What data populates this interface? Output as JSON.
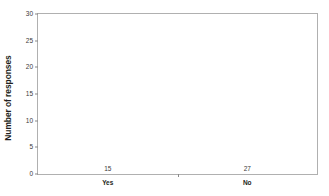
{
  "chart_data": {
    "type": "bar",
    "title": "",
    "xlabel": "",
    "ylabel": "Number of responses",
    "categories": [
      "Yes",
      "No"
    ],
    "values": [
      15,
      27
    ],
    "data_labels": [
      "15",
      "27"
    ],
    "bar_colors": [
      "#7f99cf",
      "#f7941e"
    ],
    "ylim": [
      0,
      30
    ],
    "ytick_step": 5,
    "yticks": [
      0,
      5,
      10,
      15,
      20,
      25,
      30
    ],
    "ytick_labels": [
      "0",
      "5",
      "10",
      "15",
      "20",
      "25",
      "30"
    ],
    "grid": false,
    "legend": "none",
    "plot_border_color": "#b0b0b0"
  }
}
